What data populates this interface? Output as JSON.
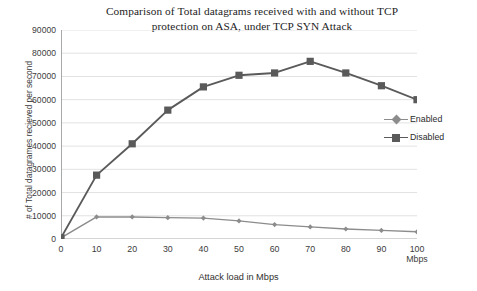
{
  "chart_data": {
    "type": "line",
    "title": "Comparison of Total datagrams received with and without TCP protection on ASA, under TCP SYN Attack",
    "title_line1": "Comparison of Total datagrams received with and without TCP",
    "title_line2": "protection on ASA, under TCP SYN Attack",
    "xlabel": "Attack load in Mbps",
    "ylabel": "# of Total datagrames recieved per second",
    "x": [
      0,
      10,
      20,
      30,
      40,
      50,
      60,
      70,
      80,
      90,
      100
    ],
    "xtick_labels": [
      "0",
      "10",
      "20",
      "30",
      "40",
      "50",
      "60",
      "70",
      "80",
      "90",
      "100"
    ],
    "x_last_unit": "Mbps",
    "xlim": [
      0,
      100
    ],
    "ylim": [
      0,
      90000
    ],
    "ytick_labels": [
      "90000",
      "80000",
      "70000",
      "60000",
      "50000",
      "40000",
      "30000",
      "20000",
      "10000",
      "0"
    ],
    "yticks": [
      90000,
      80000,
      70000,
      60000,
      50000,
      40000,
      30000,
      20000,
      10000,
      0
    ],
    "grid": "horizontal",
    "legend_position": "right",
    "series": [
      {
        "name": "Enabled",
        "marker": "diamond",
        "color": "#8c8c8c",
        "values": [
          500,
          9500,
          9500,
          9200,
          9000,
          7800,
          6200,
          5200,
          4300,
          3700,
          3100
        ]
      },
      {
        "name": "Disabled",
        "marker": "square",
        "color": "#5a5a5a",
        "values": [
          500,
          27500,
          41000,
          55500,
          65500,
          70500,
          71500,
          76500,
          71500,
          66000,
          60000
        ]
      }
    ]
  },
  "colors": {
    "background": "#ffffff",
    "grid": "#e2e2e2",
    "axis": "#a8a8a8",
    "text": "#2b2b2b",
    "series_enabled": "#8c8c8c",
    "series_disabled": "#5a5a5a"
  }
}
